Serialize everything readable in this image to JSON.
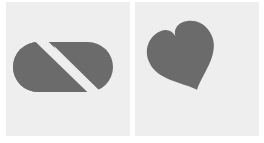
{
  "panels": [
    {
      "id": "left",
      "icon": "pill-capsule-icon",
      "shape_color": "#6b6b6b",
      "background_color": "#eeeeee"
    },
    {
      "id": "right",
      "icon": "heart-icon",
      "shape_color": "#6b6b6b",
      "background_color": "#eeeeee"
    }
  ]
}
